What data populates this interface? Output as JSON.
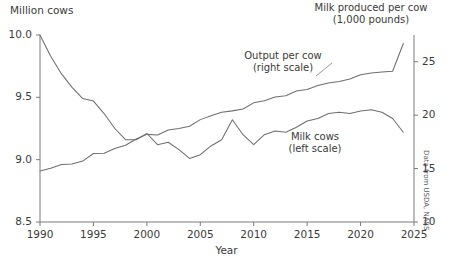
{
  "chart_data": {
    "type": "line",
    "title": "",
    "headers": {
      "left_axis_title": "Million cows",
      "right_axis_title_line1": "Milk produced per cow",
      "right_axis_title_line2": "(1,000 pounds)"
    },
    "xlabel": "Year",
    "ylabel": "Million cows",
    "y2label": "Milk produced per cow (1,000 pounds)",
    "xlim": [
      1990,
      2025
    ],
    "ylim": [
      8.5,
      10.0
    ],
    "y2lim": [
      10,
      27.5
    ],
    "grid": false,
    "legend": "inline-annotations",
    "source_note": "Data from USDA, NASS",
    "xticks": [
      "1990",
      "1995",
      "2000",
      "2005",
      "2010",
      "2015",
      "2020",
      "2025"
    ],
    "xtick_values": [
      1990,
      1995,
      2000,
      2005,
      2010,
      2015,
      2020,
      2025
    ],
    "yticks_left": [
      "8.5",
      "9.0",
      "9.5",
      "10.0"
    ],
    "ytick_left_values": [
      8.5,
      9.0,
      9.5,
      10.0
    ],
    "yticks_right": [
      "10",
      "15",
      "20",
      "25"
    ],
    "ytick_right_values": [
      10,
      15,
      20,
      25
    ],
    "annotations": [
      {
        "name": "output-per-cow",
        "line1": "Output per cow",
        "line2": "(right scale)"
      },
      {
        "name": "milk-cows",
        "line1": "Milk cows",
        "line2": "(left scale)"
      }
    ],
    "x": [
      1990,
      1991,
      1992,
      1993,
      1994,
      1995,
      1996,
      1997,
      1998,
      1999,
      2000,
      2001,
      2002,
      2003,
      2004,
      2005,
      2006,
      2007,
      2008,
      2009,
      2010,
      2011,
      2012,
      2013,
      2014,
      2015,
      2016,
      2017,
      2018,
      2019,
      2020,
      2021,
      2022,
      2023,
      2024
    ],
    "series": [
      {
        "name": "Milk cows (left scale)",
        "axis": "left",
        "units": "million cows",
        "color": "#6e6e6e",
        "values": [
          10.0,
          9.83,
          9.69,
          9.58,
          9.49,
          9.47,
          9.37,
          9.25,
          9.16,
          9.16,
          9.21,
          9.12,
          9.14,
          9.08,
          9.01,
          9.04,
          9.11,
          9.16,
          9.32,
          9.2,
          9.12,
          9.2,
          9.23,
          9.22,
          9.26,
          9.31,
          9.33,
          9.37,
          9.38,
          9.37,
          9.39,
          9.4,
          9.38,
          9.33,
          9.22
        ]
      },
      {
        "name": "Output per cow (right scale)",
        "axis": "right",
        "units": "1,000 pounds",
        "color": "#6e6e6e",
        "values": [
          14.78,
          15.03,
          15.38,
          15.42,
          15.7,
          16.41,
          16.43,
          16.87,
          17.19,
          17.76,
          18.2,
          18.14,
          18.61,
          18.75,
          18.96,
          19.58,
          19.95,
          20.27,
          20.4,
          20.57,
          21.15,
          21.35,
          21.7,
          21.82,
          22.26,
          22.39,
          22.77,
          23.0,
          23.15,
          23.39,
          23.78,
          23.95,
          24.03,
          24.11,
          26.7
        ]
      }
    ]
  }
}
